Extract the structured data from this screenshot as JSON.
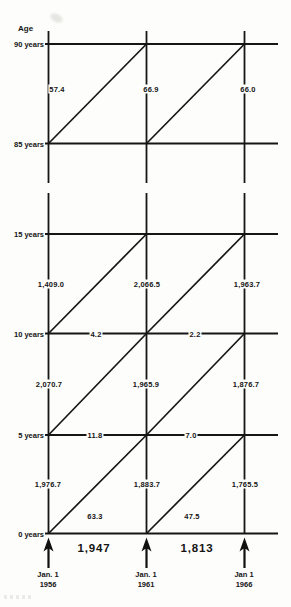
{
  "age_axis": {
    "title": "Age"
  },
  "age_lines": {
    "labels": [
      "90 years",
      "85 years",
      "15 years",
      "10 years",
      "5 years",
      "0 years"
    ]
  },
  "dates": [
    {
      "day": "Jan. 1",
      "year": "1956"
    },
    {
      "day": "Jan. 1",
      "year": "1961"
    },
    {
      "day": "Jan 1",
      "year": "1966"
    }
  ],
  "values": {
    "pop_85_90": [
      "57.4",
      "66.9",
      "66.0"
    ],
    "pop_10_15": [
      "1,409.0",
      "2,066.5",
      "1,963.7"
    ],
    "pop_5_10": [
      "2,070.7",
      "1,965.9",
      "1,876.7"
    ],
    "pop_0_5": [
      "1,976.7",
      "1,883.7",
      "1,765.5"
    ],
    "on_line_age_10": [
      "4.2",
      "2.2"
    ],
    "on_line_age_5": [
      "11.8",
      "7.0"
    ],
    "triangle_age_0_5": [
      "63.3",
      "47.5"
    ],
    "births": [
      "1,947",
      "1,813"
    ]
  }
}
